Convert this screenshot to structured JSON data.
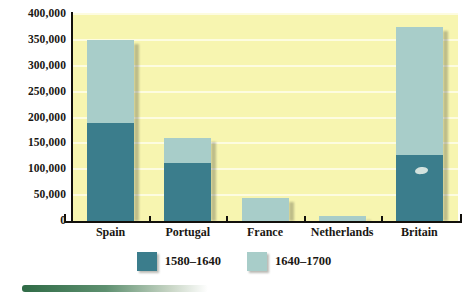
{
  "chart_data": {
    "type": "bar",
    "stacked": true,
    "title": "",
    "subtitle": "",
    "xlabel": "",
    "ylabel": "",
    "categories": [
      "Spain",
      "Portugal",
      "France",
      "Netherlands",
      "Britain"
    ],
    "series": [
      {
        "name": "1580–1640",
        "color": "#3b7d8c",
        "values": [
          190000,
          112000,
          0,
          0,
          128000
        ]
      },
      {
        "name": "1640–1700",
        "color": "#a8cdc9",
        "values": [
          160000,
          48000,
          45000,
          10000,
          247000
        ]
      }
    ],
    "totals": [
      350000,
      160000,
      45000,
      10000,
      375000
    ],
    "ylim": [
      0,
      400000
    ],
    "ytick_values": [
      0,
      50000,
      100000,
      150000,
      200000,
      250000,
      300000,
      350000,
      400000
    ],
    "ytick_labels": [
      "0",
      "50,000",
      "100,000",
      "150,000",
      "200,000",
      "250,000",
      "300,000",
      "350,000",
      "400,000"
    ],
    "grid": true,
    "grid_color": "#fdfce0",
    "plot_background": "#f7f5b0",
    "legend_position": "bottom-center",
    "legend": [
      {
        "label": "1580–1640",
        "color": "#3b7d8c"
      },
      {
        "label": "1640–1700",
        "color": "#a8cdc9"
      }
    ],
    "annotations": [
      {
        "name": "britain-bar-scratch",
        "description": "small light scuff mark on Britain dark segment"
      }
    ]
  }
}
